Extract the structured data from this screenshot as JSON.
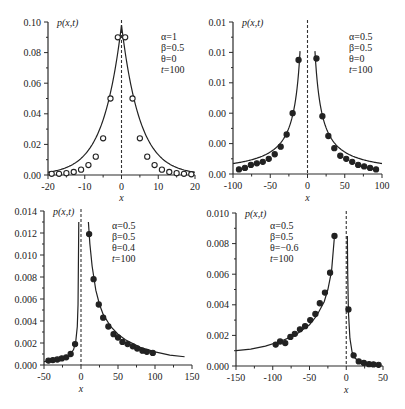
{
  "chart_data": [
    {
      "type": "line",
      "panel": "top-left",
      "title": "",
      "ylabel": "p(x,t)",
      "xlabel": "x",
      "xlim": [
        -20,
        20
      ],
      "ylim": [
        0,
        0.1
      ],
      "xticks": [
        -20,
        -10,
        0,
        10,
        20
      ],
      "xtick_labels": [
        "-20",
        "-10",
        "0",
        "10",
        "20"
      ],
      "yticks": [
        0,
        0.02,
        0.04,
        0.06,
        0.08,
        0.1
      ],
      "ytick_labels": [
        "0.00",
        "0.02",
        "0.04",
        "0.06",
        "0.08",
        "0.10"
      ],
      "annotation": [
        "α=1",
        "β=0.5",
        "θ=0",
        "t=100"
      ],
      "marker": "open-circle",
      "grid": false,
      "curve": {
        "kind": "laplace",
        "peak": 0.098,
        "scale": 5.0
      },
      "points": {
        "x": [
          -19,
          -17,
          -15,
          -13,
          -11,
          -9,
          -7,
          -5,
          -3,
          -1,
          1,
          3,
          5,
          7,
          9,
          11,
          13,
          15,
          17,
          19
        ],
        "y": [
          0.0008,
          0.0008,
          0.0012,
          0.002,
          0.0035,
          0.0065,
          0.012,
          0.024,
          0.05,
          0.09,
          0.09,
          0.05,
          0.024,
          0.012,
          0.0065,
          0.0035,
          0.002,
          0.0012,
          0.0008,
          0.0005
        ]
      }
    },
    {
      "type": "line",
      "panel": "top-right",
      "title": "",
      "ylabel": "p(x,t)",
      "xlabel": "x",
      "xlim": [
        -100,
        100
      ],
      "ylim": [
        0,
        0.01
      ],
      "xticks": [
        -100,
        -50,
        0,
        50,
        100
      ],
      "xtick_labels": [
        "-100",
        "-50",
        "0",
        "50",
        "100"
      ],
      "yticks": [
        0,
        0.002,
        0.004,
        0.006,
        0.008,
        0.01
      ],
      "ytick_labels": [
        "0.00",
        "0.00",
        "0.00",
        "0.01",
        "0.01",
        "0.01"
      ],
      "annotation": [
        "α=0.5",
        "β=0.5",
        "θ=0",
        "t=100"
      ],
      "marker": "filled-circle",
      "grid": false,
      "curve": {
        "kind": "power",
        "amp": 0.095,
        "exp": 1.07,
        "xmin": 10
      },
      "points": {
        "x": [
          -92,
          -84,
          -76,
          -68,
          -60,
          -52,
          -44,
          -36,
          -28,
          -20,
          -12,
          12,
          20,
          28,
          36,
          44,
          52,
          60,
          68,
          76,
          84,
          92
        ],
        "y": [
          0.0003,
          0.0004,
          0.0006,
          0.0007,
          0.0008,
          0.001,
          0.0013,
          0.0018,
          0.0026,
          0.004,
          0.0075,
          0.0076,
          0.0038,
          0.0025,
          0.0017,
          0.0012,
          0.001,
          0.0008,
          0.0006,
          0.0005,
          0.0004,
          0.0003
        ]
      }
    },
    {
      "type": "line",
      "panel": "bottom-left",
      "title": "",
      "ylabel": "p(x,t)",
      "xlabel": "x",
      "xlim": [
        -50,
        150
      ],
      "ylim": [
        0,
        0.014
      ],
      "xticks": [
        -50,
        0,
        50,
        100,
        150
      ],
      "xtick_labels": [
        "-50",
        "0",
        "50",
        "100",
        "150"
      ],
      "yticks": [
        0,
        0.002,
        0.004,
        0.006,
        0.008,
        0.01,
        0.012,
        0.014
      ],
      "ytick_labels": [
        "0.000",
        "0.002",
        "0.004",
        "0.006",
        "0.008",
        "0.010",
        "0.012",
        "0.014"
      ],
      "annotation": [
        "α=0.5",
        "β=0.5",
        "θ=0.4",
        "t=100"
      ],
      "marker": "filled-circle",
      "grid": false,
      "points": {
        "x": [
          -44,
          -38,
          -32,
          -26,
          -20,
          -14,
          -8,
          11,
          17,
          24,
          30,
          37,
          44,
          50,
          56,
          63,
          70,
          76,
          83,
          89,
          97
        ],
        "y": [
          0.0004,
          0.00045,
          0.0005,
          0.0006,
          0.0007,
          0.001,
          0.0019,
          0.0119,
          0.0078,
          0.0055,
          0.0043,
          0.0035,
          0.0028,
          0.0025,
          0.0021,
          0.0019,
          0.0017,
          0.0015,
          0.0013,
          0.0012,
          0.0011
        ]
      },
      "curve": {
        "x": [
          -50,
          -40,
          -30,
          -20,
          -15,
          -10,
          -7,
          -5,
          -4,
          -3,
          10,
          12,
          15,
          20,
          25,
          30,
          40,
          50,
          60,
          80,
          100,
          120,
          140
        ],
        "y": [
          0.0003,
          0.0004,
          0.0005,
          0.0007,
          0.0009,
          0.0014,
          0.0022,
          0.0035,
          0.0055,
          0.013,
          0.013,
          0.011,
          0.009,
          0.0068,
          0.0055,
          0.0046,
          0.0035,
          0.0028,
          0.0023,
          0.0016,
          0.0012,
          0.0009,
          0.00075
        ]
      }
    },
    {
      "type": "line",
      "panel": "bottom-right",
      "title": "",
      "ylabel": "p(x,t)",
      "xlabel": "x",
      "xlim": [
        -150,
        50
      ],
      "ylim": [
        0,
        0.01
      ],
      "xticks": [
        -150,
        -100,
        -50,
        0,
        50
      ],
      "xtick_labels": [
        "-150",
        "-100",
        "-50",
        "0",
        "50"
      ],
      "yticks": [
        0,
        0.002,
        0.004,
        0.006,
        0.008,
        0.01
      ],
      "ytick_labels": [
        "0.000",
        "0.002",
        "0.004",
        "0.006",
        "0.008",
        "0.010"
      ],
      "annotation": [
        "α=0.5",
        "β=0.5",
        "θ=−0.6",
        "t=100"
      ],
      "marker": "filled-circle",
      "grid": false,
      "points": {
        "x": [
          -96,
          -90,
          -83,
          -76,
          -70,
          -63,
          -56,
          -49,
          -42,
          -36,
          -29,
          -22,
          -16,
          3,
          10,
          17,
          24,
          31,
          37,
          44
        ],
        "y": [
          0.0014,
          0.0016,
          0.0015,
          0.0019,
          0.0021,
          0.0024,
          0.0026,
          0.003,
          0.0034,
          0.0041,
          0.0048,
          0.0061,
          0.0085,
          0.0037,
          0.0007,
          0.0003,
          0.0002,
          0.00012,
          0.0001,
          8e-05
        ]
      },
      "curve": {
        "x": [
          -150,
          -130,
          -110,
          -90,
          -70,
          -50,
          -40,
          -30,
          -25,
          -20,
          -16,
          1.5,
          2,
          3,
          5,
          8,
          12,
          20,
          30,
          45
        ],
        "y": [
          0.001,
          0.0011,
          0.0013,
          0.0016,
          0.002,
          0.0027,
          0.0033,
          0.0042,
          0.005,
          0.0062,
          0.0085,
          0.0085,
          0.006,
          0.0035,
          0.0018,
          0.0009,
          0.0005,
          0.00025,
          0.00012,
          6e-05
        ]
      }
    }
  ],
  "layout": {
    "panels": [
      {
        "left": 48,
        "right": 195,
        "top": 22,
        "bottom": 175,
        "xlabel_y": 201
      },
      {
        "left": 233,
        "right": 382,
        "top": 22,
        "bottom": 174,
        "xlabel_y": 201
      },
      {
        "left": 44,
        "right": 192,
        "top": 211,
        "bottom": 365,
        "xlabel_y": 392
      },
      {
        "left": 236,
        "right": 383,
        "top": 213,
        "bottom": 366,
        "xlabel_y": 393
      }
    ]
  }
}
